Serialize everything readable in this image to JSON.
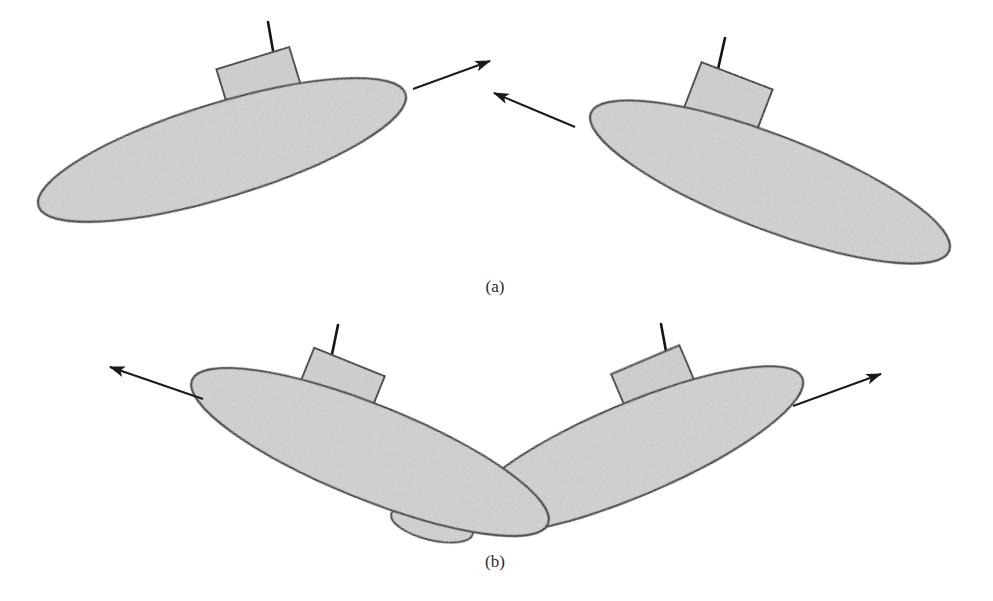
{
  "figure": {
    "background_color": "#ffffff",
    "width": 993,
    "height": 601
  },
  "style": {
    "hull_fill": "#d2d2d2",
    "hull_stroke": "#1a1a1a",
    "sail_fill": "#d0d0d0",
    "sail_stroke": "#1a1a1a",
    "mast_color": "#141414",
    "arrow_color": "#1a1a1a",
    "caption_color": "#2b2b2b",
    "hull_stroke_width": 2.2,
    "sail_stroke_width": 2.0,
    "mast_stroke_width": 2.6,
    "arrow_stroke_width": 2.0
  },
  "panels": [
    {
      "id": "a",
      "caption": "(a)",
      "description": "Two submarines on converging head-on courses",
      "vessels": [
        {
          "id": "a-left",
          "name": "submarine-a-left",
          "hull": {
            "cx": 222,
            "cy": 150,
            "rx": 192,
            "ry": 47,
            "rotation": -17
          },
          "sail": {
            "cx": 261,
            "cy": 85,
            "w": 76,
            "h": 56,
            "rotation": -17
          },
          "mast": {
            "x1": 275,
            "y1": 62,
            "x2": 268,
            "y2": 22
          },
          "heading": "up-right"
        },
        {
          "id": "a-right",
          "name": "submarine-a-right",
          "hull": {
            "cx": 770,
            "cy": 182,
            "rx": 192,
            "ry": 47,
            "rotation": 21
          },
          "sail": {
            "cx": 727,
            "cy": 102,
            "w": 76,
            "h": 56,
            "rotation": 21
          },
          "mast": {
            "x1": 716,
            "y1": 78,
            "x2": 725,
            "y2": 38
          },
          "heading": "up-left"
        }
      ],
      "arrows": [
        {
          "id": "a-arrow-left",
          "name": "motion-arrow-a-left",
          "x1": 413,
          "y1": 89,
          "x2": 490,
          "y2": 61,
          "direction": "up-right"
        },
        {
          "id": "a-arrow-right",
          "name": "motion-arrow-a-right",
          "x1": 575,
          "y1": 127,
          "x2": 494,
          "y2": 93,
          "direction": "up-left"
        }
      ]
    },
    {
      "id": "b",
      "caption": "(b)",
      "description": "Two submarines in crossing V-formation on diverging courses",
      "vessels": [
        {
          "id": "b-left",
          "name": "submarine-b-left",
          "hull": {
            "cx": 370,
            "cy": 452,
            "rx": 192,
            "ry": 47,
            "rotation": 22
          },
          "sail": {
            "cx": 339,
            "cy": 388,
            "w": 76,
            "h": 56,
            "rotation": 22
          },
          "mast": {
            "x1": 330,
            "y1": 364,
            "x2": 338,
            "y2": 325
          },
          "fin": {
            "cx": 432,
            "cy": 524,
            "rx": 42,
            "ry": 16,
            "rotation": 14
          },
          "heading": "up-left"
        },
        {
          "id": "b-right",
          "name": "submarine-b-right",
          "hull": {
            "cx": 632,
            "cy": 450,
            "rx": 185,
            "ry": 46,
            "rotation": -23
          },
          "sail": {
            "cx": 656,
            "cy": 385,
            "w": 74,
            "h": 55,
            "rotation": -23
          },
          "mast": {
            "x1": 668,
            "y1": 362,
            "x2": 661,
            "y2": 324
          },
          "heading": "up-right"
        }
      ],
      "arrows": [
        {
          "id": "b-arrow-left",
          "name": "motion-arrow-b-left",
          "x1": 203,
          "y1": 399,
          "x2": 110,
          "y2": 367,
          "direction": "up-left"
        },
        {
          "id": "b-arrow-right",
          "name": "motion-arrow-b-right",
          "x1": 793,
          "y1": 406,
          "x2": 881,
          "y2": 374,
          "direction": "up-right"
        }
      ]
    }
  ]
}
